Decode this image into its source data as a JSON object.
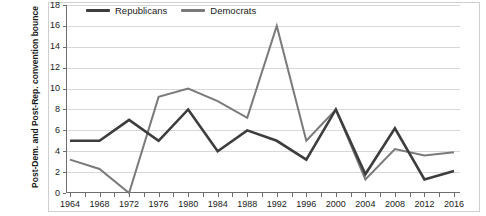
{
  "chart_data": {
    "type": "line",
    "title": "",
    "xlabel": "",
    "ylabel": "Post-Dem. and Post-Rep. convention bounce",
    "categories": [
      "1964",
      "1968",
      "1972",
      "1976",
      "1980",
      "1984",
      "1988",
      "1992",
      "1996",
      "2000",
      "2004",
      "2008",
      "2012",
      "2016"
    ],
    "x": [
      1964,
      1968,
      1972,
      1976,
      1980,
      1984,
      1988,
      1992,
      1996,
      2000,
      2004,
      2008,
      2012,
      2016
    ],
    "ylim": [
      0,
      18
    ],
    "xlim": [
      1964,
      2016
    ],
    "y_ticks": [
      0,
      2,
      4,
      6,
      8,
      10,
      12,
      14,
      16,
      18
    ],
    "grid": "horizontal",
    "legend_position": "top-left",
    "series": [
      {
        "name": "Republicans",
        "color": "#3d3d3d",
        "values": [
          5.0,
          5.0,
          7.0,
          5.0,
          8.0,
          4.0,
          6.0,
          5.0,
          3.2,
          8.0,
          1.8,
          6.2,
          1.3,
          2.1
        ]
      },
      {
        "name": "Democrats",
        "color": "#7a7a7a",
        "values": [
          3.2,
          2.3,
          0.0,
          9.2,
          10.0,
          8.8,
          7.2,
          16.0,
          5.0,
          8.0,
          1.3,
          4.2,
          3.6,
          3.9
        ]
      }
    ]
  },
  "legend": {
    "items": [
      {
        "label": "Republicans",
        "color": "#3d3d3d"
      },
      {
        "label": "Democrats",
        "color": "#7a7a7a"
      }
    ]
  },
  "axis": {
    "y_title": "Post-Dem. and Post-Rep. convention bounce"
  }
}
